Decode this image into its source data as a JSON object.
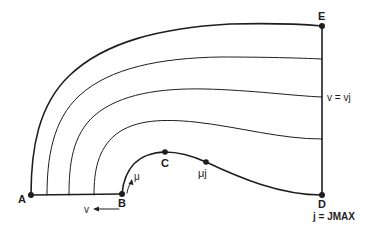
{
  "diagram": {
    "type": "computational-grid-schematic",
    "points": [
      {
        "id": "A",
        "label": "A"
      },
      {
        "id": "B",
        "label": "B"
      },
      {
        "id": "C",
        "label": "C"
      },
      {
        "id": "mu_j",
        "label": "μj"
      },
      {
        "id": "D",
        "label": "D"
      },
      {
        "id": "E",
        "label": "E"
      }
    ],
    "annotations": {
      "v_eq_vj": "v = vj",
      "j_eq_jmax": "j = JMAX",
      "mu_arrow": "μ",
      "v_arrow": "v"
    },
    "grid_lines_count": 4,
    "line_color": "#1e1e1e"
  }
}
